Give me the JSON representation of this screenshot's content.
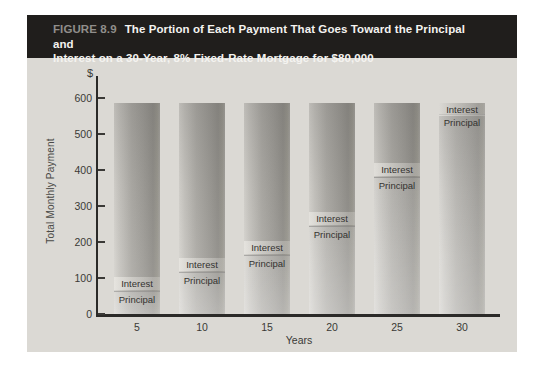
{
  "figure": {
    "label": "FIGURE 8.9",
    "title_line1": "The Portion of Each Payment That Goes Toward the Principal and",
    "title_line2": "Interest on a 30-Year, 8% Fixed-Rate Mortgage for $80,000"
  },
  "chart_data": {
    "type": "bar",
    "stacked": true,
    "title": "The Portion of Each Payment That Goes Toward the Principal and Interest on a 30-Year, 8% Fixed-Rate Mortgage for $80,000",
    "xlabel": "Years",
    "ylabel": "Total Monthly Payment",
    "currency_symbol": "$",
    "categories": [
      "5",
      "10",
      "15",
      "20",
      "25",
      "30"
    ],
    "yticks": [
      0,
      100,
      200,
      300,
      400,
      500,
      600
    ],
    "ylim": [
      0,
      650
    ],
    "grid": false,
    "legend": "none",
    "total_monthly_payment": 587,
    "segment_label_top": "Interest",
    "segment_label_bottom": "Principal",
    "series": [
      {
        "name": "Principal",
        "values": [
          65,
          118,
          165,
          245,
          380,
          555
        ]
      },
      {
        "name": "Interest",
        "values": [
          522,
          469,
          422,
          342,
          207,
          32
        ]
      }
    ]
  },
  "colors": {
    "panel_bg": "#dbd9d4",
    "header_bg": "#201e1c",
    "header_label": "#908e8b",
    "header_title": "#f4f3f0",
    "axis": "#2b2a28",
    "bar_light": "#d5d3ce",
    "bar_dark": "#918f8a",
    "text": "#3a3936"
  }
}
